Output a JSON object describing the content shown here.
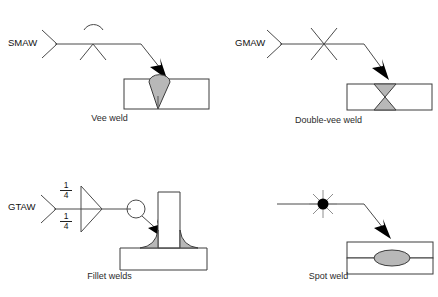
{
  "diagram": {
    "colors": {
      "line": "#4a4a4a",
      "part_outline": "#3c3c3c",
      "weld_fill": "#b8b8b8",
      "arrow_fill": "#000000",
      "ray": "#8e8e8e",
      "background": "#ffffff",
      "text": "#1a1a1a"
    },
    "panels": [
      {
        "id": "vee-weld",
        "caption": "Vee weld",
        "process_label": "SMAW",
        "tail": "open-v-tail",
        "weld_symbol": "vee-groove-below-reference-line",
        "contour_symbol": "convex-arc-above",
        "symbol_side": "below",
        "joint": "butt-joint",
        "weld_shape": "single-vee-groove",
        "dimensions": []
      },
      {
        "id": "double-vee-weld",
        "caption": "Double-vee weld",
        "process_label": "GMAW",
        "tail": "open-v-tail",
        "weld_symbol": "double-vee-groove-x",
        "contour_symbol": "none",
        "symbol_side": "both",
        "joint": "butt-joint",
        "weld_shape": "double-vee-groove-hourglass",
        "dimensions": []
      },
      {
        "id": "fillet-welds",
        "caption": "Fillet welds",
        "process_label": "GTAW",
        "tail": "open-v-tail",
        "weld_symbol": "fillet-triangle-both-sides",
        "contour_symbol": "weld-all-around-circle",
        "symbol_side": "both",
        "joint": "tee-joint",
        "weld_shape": "fillet-both-sides",
        "dimensions": [
          {
            "position": "above",
            "value": "1",
            "divider": "/",
            "denominator": "4"
          },
          {
            "position": "below",
            "value": "1",
            "divider": "/",
            "denominator": "4"
          }
        ]
      },
      {
        "id": "spot-weld",
        "caption": "Spot weld",
        "process_label": "",
        "tail": "none",
        "weld_symbol": "spot-weld-starburst-circle",
        "contour_symbol": "none",
        "symbol_side": "on-line",
        "joint": "lap-joint",
        "weld_shape": "spot-nugget-ellipse",
        "dimensions": []
      }
    ]
  }
}
